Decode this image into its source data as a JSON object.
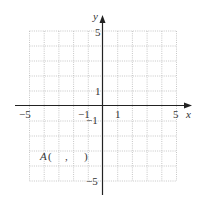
{
  "axes": {
    "x_label": "x",
    "y_label": "y",
    "x_range": [
      -5,
      5
    ],
    "y_range": [
      -5,
      5
    ],
    "tick_labels": {
      "x_neg5": "−5",
      "x_neg1": "−1",
      "x_pos1": "1",
      "x_pos5": "5",
      "y_pos5": "5",
      "y_pos1": "1",
      "y_neg1": "−1",
      "y_neg5": "−5"
    }
  },
  "grid": {
    "style": "dotted",
    "color": "#b8b8b8",
    "cells": 10
  },
  "point": {
    "name": "A",
    "open": "(",
    "comma": ",",
    "close": ")"
  }
}
